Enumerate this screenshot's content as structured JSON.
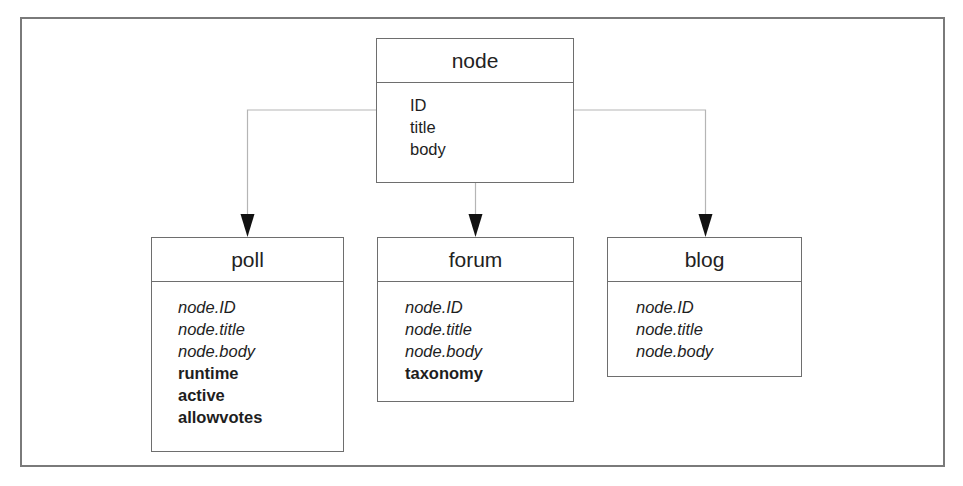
{
  "diagram": {
    "colors": {
      "frame": "#7a7a7a",
      "box_border": "#6e6e6e",
      "connector": "#b5b5b5",
      "arrowhead": "#111111",
      "text": "#1e1e1e"
    },
    "parent": {
      "title": "node",
      "attributes": [
        {
          "text": "ID",
          "style": "regular"
        },
        {
          "text": "title",
          "style": "regular"
        },
        {
          "text": "body",
          "style": "regular"
        }
      ]
    },
    "children": [
      {
        "title": "poll",
        "attributes": [
          {
            "text": "node.ID",
            "style": "italic"
          },
          {
            "text": "node.title",
            "style": "italic"
          },
          {
            "text": "node.body",
            "style": "italic"
          },
          {
            "text": "runtime",
            "style": "bold"
          },
          {
            "text": "active",
            "style": "bold"
          },
          {
            "text": "allowvotes",
            "style": "bold"
          }
        ]
      },
      {
        "title": "forum",
        "attributes": [
          {
            "text": "node.ID",
            "style": "italic"
          },
          {
            "text": "node.title",
            "style": "italic"
          },
          {
            "text": "node.body",
            "style": "italic"
          },
          {
            "text": "taxonomy",
            "style": "bold"
          }
        ]
      },
      {
        "title": "blog",
        "attributes": [
          {
            "text": "node.ID",
            "style": "italic"
          },
          {
            "text": "node.title",
            "style": "italic"
          },
          {
            "text": "node.body",
            "style": "italic"
          }
        ]
      }
    ],
    "edges": [
      {
        "from": "node",
        "to": "poll"
      },
      {
        "from": "node",
        "to": "forum"
      },
      {
        "from": "node",
        "to": "blog"
      }
    ]
  }
}
